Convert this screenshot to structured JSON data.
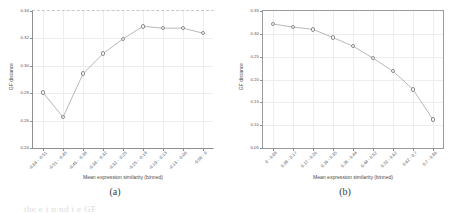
{
  "figure": {
    "panels": [
      {
        "caption": "(a)",
        "frame_style": "open",
        "chart_data": {
          "type": "line",
          "title": "",
          "xlabel": "Mean expression similarity (binned)",
          "ylabel": "GF distance",
          "ylim": [
            0.24,
            0.34
          ],
          "yticks": [
            "0.24",
            "0.26",
            "0.28",
            "0.30",
            "0.32",
            "0.34"
          ],
          "ytick_values": [
            0.24,
            0.26,
            0.28,
            0.3,
            0.32,
            0.34
          ],
          "grid": true,
          "legend": "none",
          "categories": [
            "-0.64 - -0.51",
            "-0.51 - -0.45",
            "-0.45 - -0.38",
            "-0.38 - -0.32",
            "-0.32 - -0.25",
            "-0.25 - -0.19",
            "-0.19 - -0.13",
            "-0.13 - -0.06",
            "-0.06 - 0"
          ],
          "values": [
            0.2805,
            0.2625,
            0.2942,
            0.3088,
            0.3197,
            0.3288,
            0.3275,
            0.3275,
            0.3238
          ]
        }
      },
      {
        "caption": "(b)",
        "frame_style": "full",
        "chart_data": {
          "type": "line",
          "title": "",
          "xlabel": "Mean expression similarity (binned)",
          "ylabel": "GF distance",
          "ylim": [
            0.05,
            0.35
          ],
          "yticks": [
            "0.05",
            "0.10",
            "0.15",
            "0.20",
            "0.25",
            "0.30",
            "0.35"
          ],
          "ytick_values": [
            0.05,
            0.1,
            0.15,
            0.2,
            0.25,
            0.3,
            0.35
          ],
          "grid": true,
          "legend": "none",
          "categories": [
            "0 - 0.08",
            "0.08 - 0.17",
            "0.17 - 0.26",
            "0.26 - 0.35",
            "0.35 - 0.44",
            "0.44 - 0.52",
            "0.52 - 0.62",
            "0.62 - 0.7",
            "0.7 - 0.86"
          ],
          "values": [
            0.3215,
            0.3148,
            0.3098,
            0.2918,
            0.273,
            0.2468,
            0.2182,
            0.1785,
            0.112
          ]
        }
      }
    ],
    "footer_fragment": "the e t n nd t e GF"
  }
}
